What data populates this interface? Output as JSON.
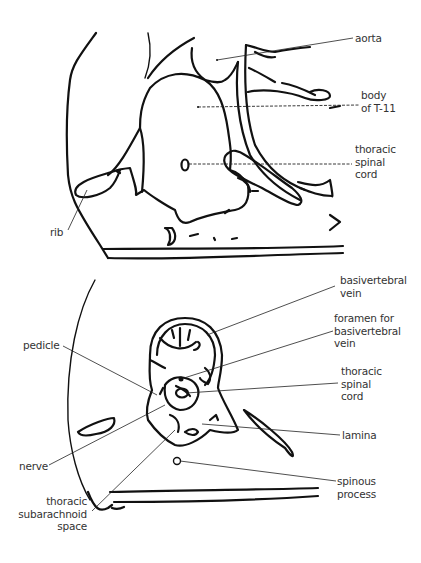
{
  "figure": {
    "top_panel": {
      "name": "sagittal view of T-11 region",
      "labels": [
        {
          "id": "aorta",
          "text": "aorta"
        },
        {
          "id": "body_t11",
          "text": "body\nof T-11"
        },
        {
          "id": "thoracic_spinal_cord",
          "text": "thoracic\nspinal\ncord"
        },
        {
          "id": "rib",
          "text": "rib"
        }
      ]
    },
    "bottom_panel": {
      "name": "axial cross-section of thoracic vertebra",
      "labels": [
        {
          "id": "basivertebral_vein",
          "text": "basivertebral\nvein"
        },
        {
          "id": "foramen",
          "text": "foramen for\nbasivertebral\nvein"
        },
        {
          "id": "thoracic_spinal_cord",
          "text": "thoracic\nspinal\ncord"
        },
        {
          "id": "pedicle",
          "text": "pedicle"
        },
        {
          "id": "lamina",
          "text": "lamina"
        },
        {
          "id": "nerve",
          "text": "nerve"
        },
        {
          "id": "spinous_process",
          "text": "spinous\nprocess"
        },
        {
          "id": "subarachnoid_space",
          "text": "thoracic\nsubarachnoid\nspace"
        }
      ]
    },
    "colors": {
      "ink": "#111111",
      "label": "#333333",
      "background": "#ffffff"
    }
  }
}
